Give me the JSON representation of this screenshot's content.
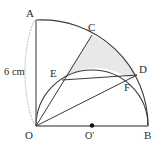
{
  "figure": {
    "dimension_label": "6 cm",
    "colors": {
      "stroke": "#3a3a3a",
      "baseline": "#6e6e6e",
      "shaded_region": "#e8e8e8",
      "dotted_guide": "#b9b9b9",
      "label_text": "#2b2b2b"
    },
    "points": [
      {
        "name": "A",
        "label": "A",
        "x": 36,
        "y": 20,
        "label_x": 26,
        "label_y": 8
      },
      {
        "name": "C",
        "label": "C",
        "x": 92,
        "y": 35,
        "label_x": 88,
        "label_y": 22
      },
      {
        "name": "D",
        "label": "D",
        "x": 137,
        "y": 75,
        "label_x": 139,
        "label_y": 64
      },
      {
        "name": "E",
        "label": "E",
        "x": 62,
        "y": 80,
        "label_x": 50,
        "label_y": 68
      },
      {
        "name": "F",
        "label": "F",
        "x": 131,
        "y": 80,
        "label_x": 124,
        "label_y": 82
      },
      {
        "name": "O",
        "label": "O",
        "x": 36,
        "y": 126,
        "label_x": 25,
        "label_y": 130
      },
      {
        "name": "O'",
        "label": "O'",
        "x": 92,
        "y": 126,
        "label_x": 85,
        "label_y": 130
      },
      {
        "name": "B",
        "label": "B",
        "x": 148,
        "y": 126,
        "label_x": 144,
        "label_y": 130
      }
    ],
    "segments": [
      {
        "name": "radius-OA",
        "from": "O",
        "to": "A"
      },
      {
        "name": "baseline-OB",
        "from": "O",
        "to": "B"
      },
      {
        "name": "ray-OC-through-E",
        "from": "O",
        "to": "C"
      },
      {
        "name": "ray-OD-through-F",
        "from": "O",
        "to": "D"
      },
      {
        "name": "chord-ED",
        "from": "E",
        "to": "D"
      }
    ],
    "arcs": [
      {
        "name": "quarter-arc-AB",
        "center": "O",
        "radius": 106,
        "from": "A",
        "to": "B"
      },
      {
        "name": "semicircle-OB",
        "center": "O'",
        "radius": 56,
        "from": "O",
        "to": "B"
      },
      {
        "name": "dotted-measure-arc",
        "from": "A",
        "to": "O",
        "style": "dotted"
      }
    ],
    "shaded_region": {
      "name": "curvilinear-triangle-ECD",
      "vertices": [
        "E",
        "C",
        "D"
      ],
      "boundaries": [
        "line E-C",
        "arc C-D on quarter circle",
        "line D-E",
        "arc E-F-D on semicircle"
      ]
    }
  }
}
